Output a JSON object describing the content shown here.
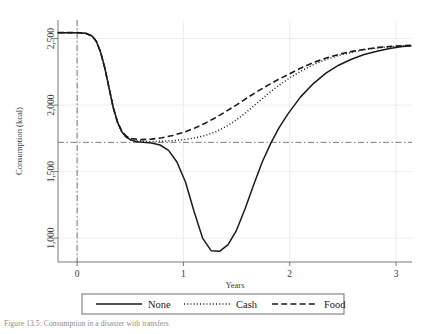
{
  "figure": {
    "caption": "Figure 13.5: Consumption in a disaster with transfers"
  },
  "chart_data": {
    "type": "line",
    "title": "",
    "xlabel": "Years",
    "ylabel": "Consumption (kcal)",
    "xlim": [
      -0.18,
      3.15
    ],
    "ylim": [
      820,
      2640
    ],
    "xticks": [
      0,
      1,
      2,
      3
    ],
    "xtick_labels": [
      "0",
      "1",
      "2",
      "3"
    ],
    "yticks": [
      1000,
      1500,
      2000,
      2500
    ],
    "ytick_labels": [
      "1,000",
      "1,500",
      "2,000",
      "2,500"
    ],
    "grid": true,
    "grid_axis": "both",
    "legend_position": "bottom-center",
    "reference_lines": [
      {
        "name": "subsistence-line",
        "orientation": "horizontal",
        "value": 1720,
        "style": "dash-dot"
      },
      {
        "name": "disaster-onset-line",
        "orientation": "vertical",
        "value": 0,
        "style": "dash-dot"
      }
    ],
    "series": [
      {
        "name": "None",
        "style": "solid",
        "color": "#1a1a1a",
        "x": [
          -0.18,
          -0.1,
          0.0,
          0.08,
          0.14,
          0.18,
          0.22,
          0.26,
          0.3,
          0.34,
          0.38,
          0.42,
          0.46,
          0.5,
          0.56,
          0.62,
          0.7,
          0.78,
          0.86,
          0.94,
          1.02,
          1.1,
          1.18,
          1.26,
          1.34,
          1.42,
          1.5,
          1.58,
          1.66,
          1.74,
          1.82,
          1.9,
          1.98,
          2.1,
          2.22,
          2.34,
          2.46,
          2.58,
          2.7,
          2.82,
          2.94,
          3.06,
          3.14
        ],
        "y": [
          2545,
          2545,
          2545,
          2540,
          2520,
          2480,
          2400,
          2280,
          2130,
          1980,
          1870,
          1800,
          1760,
          1740,
          1725,
          1720,
          1715,
          1700,
          1660,
          1570,
          1420,
          1200,
          1000,
          905,
          900,
          950,
          1060,
          1220,
          1400,
          1570,
          1710,
          1830,
          1930,
          2060,
          2160,
          2240,
          2300,
          2345,
          2380,
          2405,
          2425,
          2440,
          2445
        ]
      },
      {
        "name": "Cash",
        "style": "dotted",
        "color": "#1a1a1a",
        "x": [
          -0.18,
          -0.1,
          0.0,
          0.08,
          0.14,
          0.18,
          0.22,
          0.26,
          0.3,
          0.34,
          0.38,
          0.42,
          0.46,
          0.5,
          0.6,
          0.7,
          0.8,
          0.9,
          1.0,
          1.1,
          1.2,
          1.3,
          1.4,
          1.5,
          1.6,
          1.7,
          1.8,
          1.9,
          2.0,
          2.12,
          2.24,
          2.36,
          2.48,
          2.6,
          2.72,
          2.84,
          2.96,
          3.08,
          3.14
        ],
        "y": [
          2545,
          2545,
          2545,
          2540,
          2520,
          2480,
          2400,
          2280,
          2130,
          1980,
          1870,
          1800,
          1762,
          1742,
          1728,
          1726,
          1728,
          1732,
          1740,
          1752,
          1770,
          1798,
          1838,
          1890,
          1952,
          2020,
          2088,
          2150,
          2205,
          2262,
          2310,
          2348,
          2378,
          2400,
          2418,
          2432,
          2440,
          2446,
          2448
        ]
      },
      {
        "name": "Food",
        "style": "dashed",
        "color": "#1a1a1a",
        "x": [
          -0.18,
          -0.1,
          0.0,
          0.08,
          0.14,
          0.18,
          0.22,
          0.26,
          0.3,
          0.34,
          0.38,
          0.42,
          0.46,
          0.5,
          0.6,
          0.7,
          0.8,
          0.9,
          1.0,
          1.1,
          1.2,
          1.3,
          1.4,
          1.5,
          1.6,
          1.7,
          1.8,
          1.9,
          2.0,
          2.12,
          2.24,
          2.36,
          2.48,
          2.6,
          2.72,
          2.84,
          2.96,
          3.08,
          3.14
        ],
        "y": [
          2545,
          2545,
          2545,
          2540,
          2520,
          2480,
          2400,
          2280,
          2130,
          1980,
          1872,
          1805,
          1768,
          1750,
          1740,
          1744,
          1755,
          1772,
          1795,
          1825,
          1862,
          1905,
          1952,
          2002,
          2055,
          2105,
          2152,
          2196,
          2236,
          2285,
          2325,
          2358,
          2385,
          2406,
          2422,
          2434,
          2442,
          2448,
          2450
        ]
      }
    ],
    "legend": [
      {
        "label": "None",
        "style": "solid"
      },
      {
        "label": "Cash",
        "style": "dotted"
      },
      {
        "label": "Food",
        "style": "dashed"
      }
    ]
  }
}
